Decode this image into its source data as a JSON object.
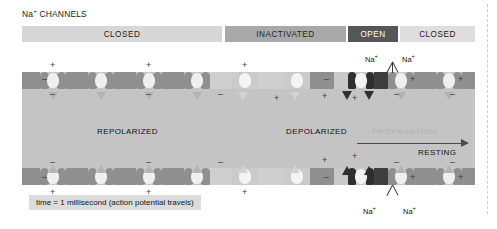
{
  "figure": {
    "title_prefix": "Na",
    "title_sup": "+",
    "title_rest": " CHANNELS",
    "caption": "time = 1 millisecond (action potential travels)"
  },
  "state_bar": {
    "segments": [
      {
        "label": "CLOSED",
        "state": "closed",
        "color": "#d7d7d7",
        "text_color": "#222222"
      },
      {
        "label": "INACTIVATED",
        "state": "inactivated",
        "color": "#a9a9a9",
        "text_color": "#222222"
      },
      {
        "label": "OPEN",
        "state": "open",
        "color": "#575757",
        "text_color": "#ffffff"
      },
      {
        "label": "CLOSED",
        "state": "closed",
        "color": "#dedede",
        "text_color": "#222222"
      }
    ]
  },
  "membrane_labels": {
    "repolarized": "REPOLARIZED",
    "depolarized": "DEPOLARIZED",
    "propagation": "PROPAGATION",
    "resting": "RESTING"
  },
  "ions": {
    "top_left": {
      "text": "Na",
      "sup": "+"
    },
    "top_right": {
      "text": "Na",
      "sup": "+"
    },
    "bottom_left": {
      "text": "Na",
      "sup": "+"
    },
    "bottom_right": {
      "text": "Na",
      "sup": "+"
    }
  },
  "charges": {
    "outside_left_symbol": "+",
    "inside_left_symbol": "–",
    "outside_right_symbol": "–",
    "inside_right_symbol": "+"
  },
  "colors": {
    "axon_fill": "#c4c4c4",
    "membrane": "#8f8f8f",
    "channel_open": "#2f2f2f",
    "channel_inactivated": "#cbcbcb",
    "background": "#ffffff"
  }
}
